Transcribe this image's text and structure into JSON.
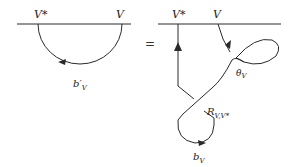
{
  "diagram": {
    "left": {
      "top_labels": {
        "dual": "V*",
        "object": "V"
      },
      "morphism_label": {
        "base": "b",
        "prime": "′",
        "sub": "V"
      }
    },
    "equals": "=",
    "right": {
      "top_labels": {
        "dual": "V*",
        "object": "V"
      },
      "twist_label": {
        "base": "θ",
        "sub": "V"
      },
      "braiding_label": {
        "base": "R",
        "sub": "V,V*"
      },
      "coev_label": {
        "base": "b",
        "sub": "V"
      }
    },
    "colors": {
      "stroke": "#2a2a2a",
      "background": "#ffffff"
    }
  }
}
